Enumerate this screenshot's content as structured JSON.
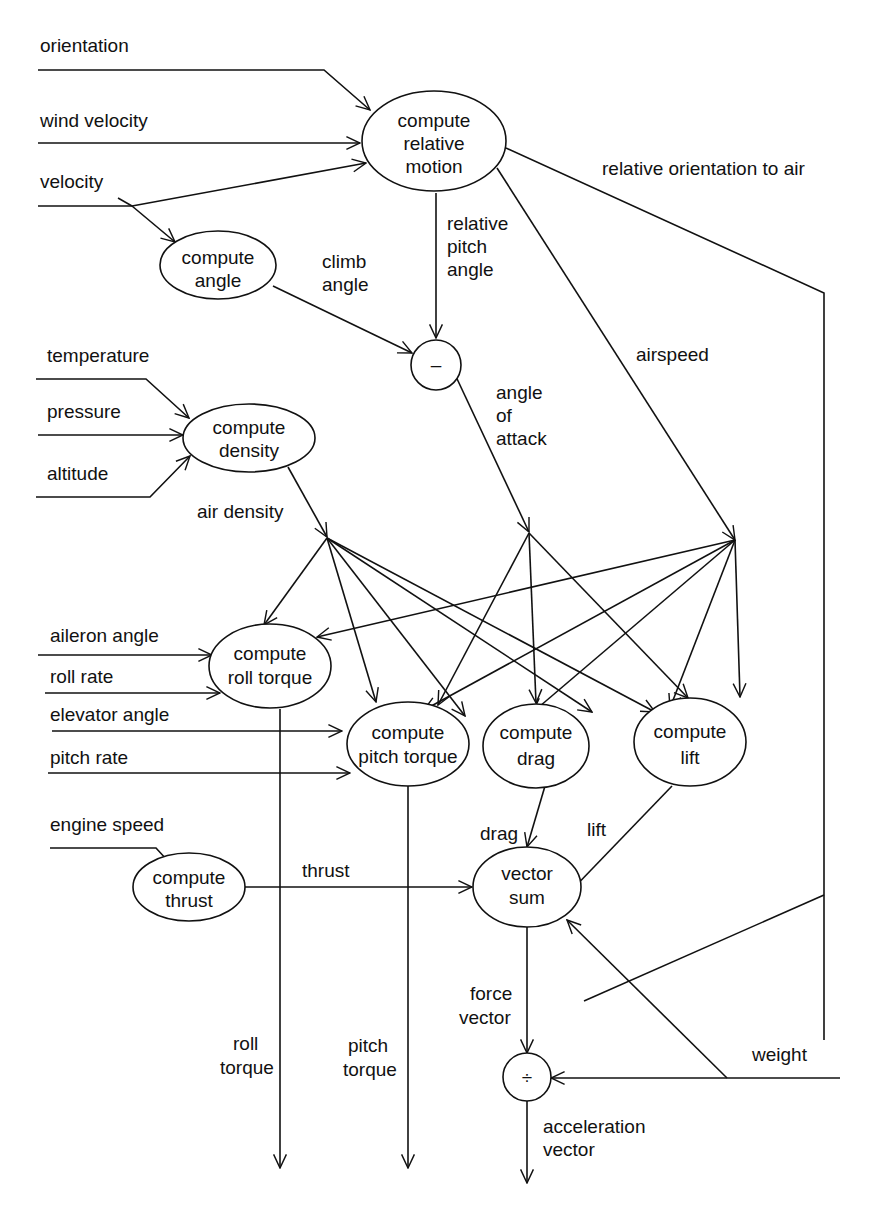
{
  "diagram": {
    "type": "dataflow",
    "inputs": {
      "orientation": "orientation",
      "wind_velocity": "wind velocity",
      "velocity": "velocity",
      "temperature": "temperature",
      "pressure": "pressure",
      "altitude": "altitude",
      "aileron_angle": "aileron angle",
      "roll_rate": "roll rate",
      "elevator_angle": "elevator angle",
      "pitch_rate": "pitch rate",
      "engine_speed": "engine speed",
      "weight": "weight"
    },
    "nodes": {
      "relative_motion": [
        "compute",
        "relative",
        "motion"
      ],
      "angle": [
        "compute",
        "angle"
      ],
      "subtract": "–",
      "density": [
        "compute",
        "density"
      ],
      "roll_torque": [
        "compute",
        "roll torque"
      ],
      "pitch_torque": [
        "compute",
        "pitch torque"
      ],
      "drag": [
        "compute",
        "drag"
      ],
      "lift": [
        "compute",
        "lift"
      ],
      "thrust": [
        "compute",
        "thrust"
      ],
      "vector_sum": [
        "vector",
        "sum"
      ],
      "divide": "÷"
    },
    "edge_labels": {
      "relative_orientation": "relative orientation to air",
      "relative_pitch_angle": [
        "relative",
        "pitch",
        "angle"
      ],
      "climb_angle": [
        "climb",
        "angle"
      ],
      "airspeed": "airspeed",
      "angle_of_attack": [
        "angle",
        "of",
        "attack"
      ],
      "air_density": "air density",
      "drag": "drag",
      "lift": "lift",
      "thrust": "thrust",
      "force_vector": [
        "force",
        "vector"
      ],
      "acceleration_vector": [
        "acceleration",
        "vector"
      ]
    },
    "outputs": {
      "roll_torque": [
        "roll",
        "torque"
      ],
      "pitch_torque": [
        "pitch",
        "torque"
      ],
      "acceleration_vector": [
        "acceleration",
        "vector"
      ]
    }
  }
}
